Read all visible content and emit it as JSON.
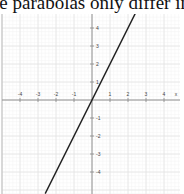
{
  "caption": "le parabolas only differ in ve",
  "chart_data": {
    "type": "line",
    "title": "",
    "xlabel": "x",
    "ylabel": "",
    "xlim": [
      -5.0,
      4.9
    ],
    "ylim": [
      -5.2,
      4.8
    ],
    "grid": true,
    "x_ticks": [
      -4,
      -3,
      -2,
      -1,
      1,
      2,
      3,
      4
    ],
    "y_ticks": [
      4,
      3,
      2,
      1,
      -1,
      -2,
      -3,
      -4
    ],
    "series": [
      {
        "name": "y = 2x",
        "x": [
          -2.6,
          2.4
        ],
        "y": [
          -5.2,
          4.8
        ],
        "color": "#222222"
      }
    ]
  },
  "style": {
    "grid_major": "#e4e4e4",
    "grid_minor": "#f3f3f3",
    "axis": "#8a8a8a",
    "line": "#222222"
  }
}
